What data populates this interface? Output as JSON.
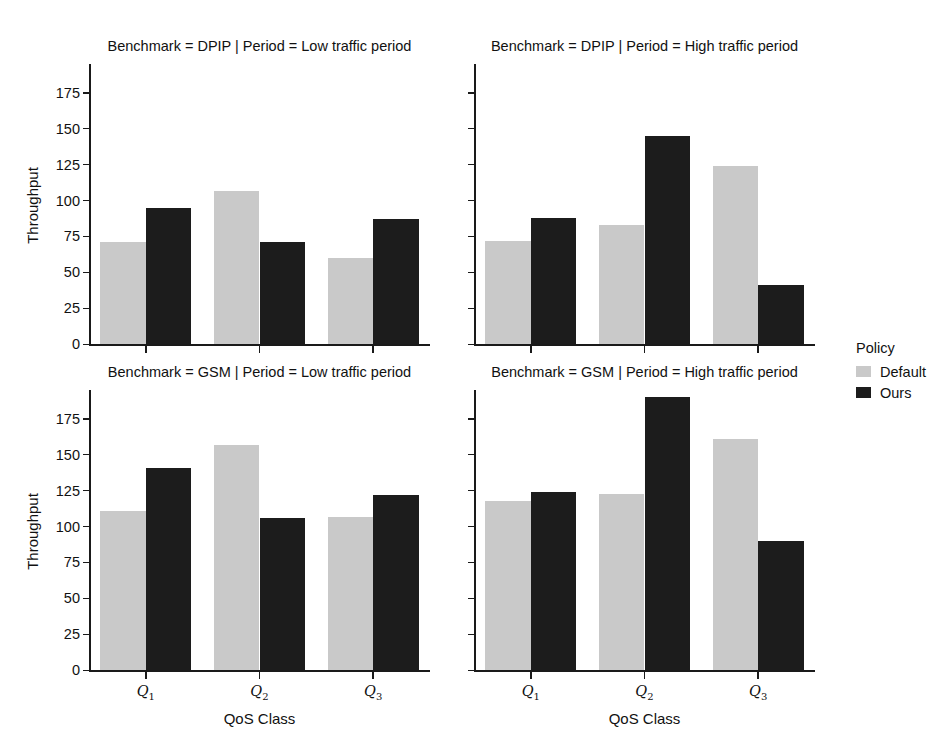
{
  "chart_data": {
    "type": "bar",
    "title": "",
    "xlabel": "QoS Class",
    "ylabel": "Throughput",
    "categories": [
      "Q1",
      "Q2",
      "Q3"
    ],
    "category_labels": [
      "Q",
      "Q",
      "Q"
    ],
    "category_subs": [
      "1",
      "2",
      "3"
    ],
    "ylim": [
      0,
      195
    ],
    "yticks": [
      0,
      25,
      50,
      75,
      100,
      125,
      150,
      175
    ],
    "ytick_labels": [
      "0",
      "25",
      "50",
      "75",
      "100",
      "125",
      "150",
      "175"
    ],
    "grid": false,
    "legend": {
      "title": "Policy",
      "position": "right",
      "entries": [
        {
          "name": "Default",
          "color": "#c9c9c9"
        },
        {
          "name": "Ours",
          "color": "#1c1c1c"
        }
      ]
    },
    "facet_rows": [
      "DPIP",
      "GSM"
    ],
    "facet_cols": [
      "Low traffic period",
      "High traffic period"
    ],
    "panels": [
      {
        "id": "dpip-low",
        "title": "Benchmark = DPIP | Period = Low traffic period",
        "benchmark": "DPIP",
        "period": "Low traffic period",
        "series": [
          {
            "name": "Default",
            "values": [
              71,
              107,
              60
            ]
          },
          {
            "name": "Ours",
            "values": [
              95,
              71,
              87
            ]
          }
        ]
      },
      {
        "id": "dpip-high",
        "title": "Benchmark = DPIP | Period = High traffic period",
        "benchmark": "DPIP",
        "period": "High traffic period",
        "series": [
          {
            "name": "Default",
            "values": [
              72,
              83,
              124
            ]
          },
          {
            "name": "Ours",
            "values": [
              88,
              145,
              41
            ]
          }
        ]
      },
      {
        "id": "gsm-low",
        "title": "Benchmark = GSM | Period = Low traffic period",
        "benchmark": "GSM",
        "period": "Low traffic period",
        "series": [
          {
            "name": "Default",
            "values": [
              111,
              157,
              107
            ]
          },
          {
            "name": "Ours",
            "values": [
              141,
              106,
              122
            ]
          }
        ]
      },
      {
        "id": "gsm-high",
        "title": "Benchmark = GSM | Period = High traffic period",
        "benchmark": "GSM",
        "period": "High traffic period",
        "series": [
          {
            "name": "Default",
            "values": [
              118,
              123,
              161
            ]
          },
          {
            "name": "Ours",
            "values": [
              124,
              190,
              90
            ]
          }
        ]
      }
    ]
  },
  "figure": {
    "background": "#ffffff",
    "axis_color": "#1a1a1a",
    "text_color": "#111111"
  }
}
